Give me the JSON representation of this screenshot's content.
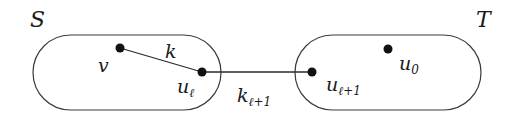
{
  "diagram": {
    "type": "graph-cut",
    "regions": [
      {
        "id": "S",
        "label": "S"
      },
      {
        "id": "T",
        "label": "T"
      }
    ],
    "nodes": [
      {
        "id": "v",
        "label": "v",
        "region": "S"
      },
      {
        "id": "u_l",
        "label": "u",
        "subscript": "ℓ",
        "region": "S"
      },
      {
        "id": "u_l1",
        "label": "u",
        "subscript": "ℓ+1",
        "region": "T"
      },
      {
        "id": "u_0",
        "label": "u",
        "subscript": "0",
        "region": "T"
      }
    ],
    "edges": [
      {
        "from": "v",
        "to": "u_l",
        "label": "k",
        "subscript": ""
      },
      {
        "from": "u_l",
        "to": "u_l1",
        "label": "k",
        "subscript": "ℓ+1"
      }
    ]
  }
}
